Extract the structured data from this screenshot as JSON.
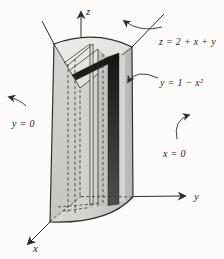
{
  "figure": {
    "type": "3d-solid-volume-diagram",
    "axis_labels": {
      "x": "x",
      "y": "y",
      "z": "z"
    },
    "labels": {
      "plane": "z = 2 + x + y",
      "cylinder": "y = 1 − x²",
      "back_wall": "y = 0",
      "side_wall": "x = 0"
    },
    "colors": {
      "paper": "#fcfbf9",
      "line": "#2e2d2a",
      "left_wall": "#cdccc8",
      "top_face": "#e9e8e4",
      "right_wall": "#c9c8c4",
      "slab": "#1c1c1b"
    }
  }
}
